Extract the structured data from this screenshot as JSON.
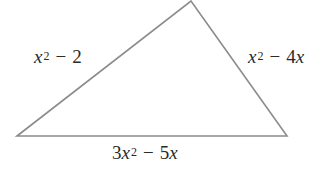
{
  "figure": {
    "type": "triangle",
    "vertices": {
      "left": [
        17,
        136
      ],
      "top": [
        191,
        1
      ],
      "right": [
        287,
        136
      ]
    },
    "stroke_color": "#8c8c8c",
    "background": "#ffffff"
  },
  "labels": {
    "left_side": {
      "text": "x^2 - 2",
      "coef": "",
      "var": "x",
      "exp": "2",
      "op": "−",
      "rest": "2",
      "rest_var": ""
    },
    "right_side": {
      "text": "x^2 - 4x",
      "coef": "",
      "var": "x",
      "exp": "2",
      "op": "−",
      "rest": "4",
      "rest_var": "x"
    },
    "bottom_side": {
      "text": "3x^2 - 5x",
      "coef": "3",
      "var": "x",
      "exp": "2",
      "op": "−",
      "rest": "5",
      "rest_var": "x"
    }
  }
}
